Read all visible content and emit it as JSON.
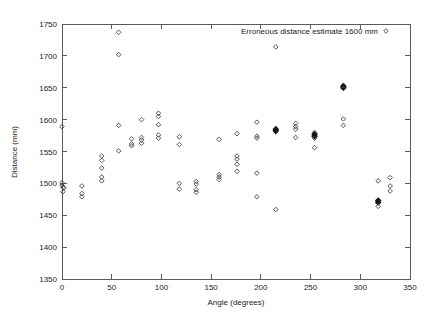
{
  "chart_data": {
    "type": "scatter",
    "title": "",
    "xlabel": "Angle (degrees)",
    "ylabel": "Distance (mm)",
    "xlim": [
      0,
      350
    ],
    "ylim": [
      1350,
      1750
    ],
    "xticks": [
      0,
      50,
      100,
      150,
      200,
      250,
      300,
      350
    ],
    "yticks": [
      1350,
      1400,
      1450,
      1500,
      1550,
      1600,
      1650,
      1700,
      1750
    ],
    "xtick_labels": [
      "0",
      "50",
      "100",
      "150",
      "200",
      "250",
      "300",
      "350"
    ],
    "ytick_labels": [
      "1350",
      "1400",
      "1450",
      "1500",
      "1550",
      "1600",
      "1650",
      "1700",
      "1750"
    ],
    "grid": false,
    "legend_position": "top-right",
    "legend": [
      {
        "label": "Erroneous distance estimate 1600 mm",
        "marker": "diamond",
        "color": "#444444"
      }
    ],
    "series": [
      {
        "name": "Erroneous distance estimate 1600 mm",
        "marker": "diamond",
        "color": "#444444",
        "points": [
          [
            0,
            1589
          ],
          [
            0,
            1501
          ],
          [
            0,
            1497
          ],
          [
            1,
            1494
          ],
          [
            1,
            1487
          ],
          [
            2,
            1493
          ],
          [
            20,
            1496
          ],
          [
            20,
            1484
          ],
          [
            20,
            1479
          ],
          [
            40,
            1543
          ],
          [
            40,
            1536
          ],
          [
            40,
            1524
          ],
          [
            40,
            1510
          ],
          [
            40,
            1504
          ],
          [
            57,
            1737
          ],
          [
            57,
            1702
          ],
          [
            57,
            1591
          ],
          [
            57,
            1551
          ],
          [
            70,
            1570
          ],
          [
            70,
            1562
          ],
          [
            70,
            1559
          ],
          [
            80,
            1600
          ],
          [
            80,
            1572
          ],
          [
            80,
            1568
          ],
          [
            80,
            1563
          ],
          [
            97,
            1610
          ],
          [
            97,
            1605
          ],
          [
            97,
            1592
          ],
          [
            97,
            1576
          ],
          [
            97,
            1571
          ],
          [
            118,
            1573
          ],
          [
            118,
            1561
          ],
          [
            118,
            1500
          ],
          [
            118,
            1491
          ],
          [
            135,
            1503
          ],
          [
            135,
            1499
          ],
          [
            135,
            1490
          ],
          [
            135,
            1486
          ],
          [
            158,
            1569
          ],
          [
            158,
            1514
          ],
          [
            158,
            1510
          ],
          [
            158,
            1506
          ],
          [
            176,
            1578
          ],
          [
            176,
            1543
          ],
          [
            176,
            1538
          ],
          [
            176,
            1530
          ],
          [
            176,
            1519
          ],
          [
            196,
            1596
          ],
          [
            196,
            1574
          ],
          [
            196,
            1571
          ],
          [
            196,
            1516
          ],
          [
            196,
            1479
          ],
          [
            215,
            1714
          ],
          [
            215,
            1585
          ],
          [
            215,
            1582
          ],
          [
            215,
            1459
          ],
          [
            235,
            1594
          ],
          [
            235,
            1589
          ],
          [
            235,
            1585
          ],
          [
            235,
            1572
          ],
          [
            254,
            1580
          ],
          [
            254,
            1577
          ],
          [
            254,
            1574
          ],
          [
            254,
            1571
          ],
          [
            254,
            1556
          ],
          [
            283,
            1654
          ],
          [
            283,
            1652
          ],
          [
            283,
            1650
          ],
          [
            283,
            1649
          ],
          [
            283,
            1601
          ],
          [
            283,
            1591
          ],
          [
            318,
            1504
          ],
          [
            318,
            1473
          ],
          [
            318,
            1470
          ],
          [
            318,
            1464
          ],
          [
            330,
            1509
          ],
          [
            330,
            1496
          ],
          [
            330,
            1488
          ]
        ]
      }
    ]
  },
  "figure": {
    "axis_x_title": "Angle (degrees)",
    "axis_y_title": "Distance (mm)",
    "legend_label": "Erroneous distance estimate 1600 mm"
  }
}
